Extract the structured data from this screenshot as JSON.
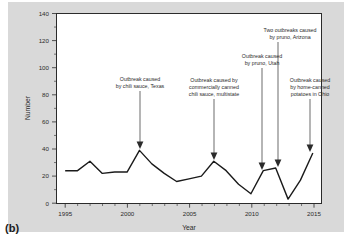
{
  "figure": {
    "panel_label": "(b)",
    "background_color": "#d9d9d9",
    "plot_background_color": "#ffffff",
    "line_color": "#1a1a1a"
  },
  "chart_data": {
    "type": "line",
    "title": "",
    "xlabel": "Year",
    "ylabel": "Number",
    "xlim": [
      1994.3,
      2015.7
    ],
    "ylim": [
      0,
      140
    ],
    "grid": false,
    "legend": null,
    "y_ticks": [
      0,
      20,
      40,
      60,
      80,
      100,
      120,
      140
    ],
    "y_tick_labels": [
      "0",
      "20",
      "40",
      "60",
      "80",
      "100",
      "120",
      "140"
    ],
    "y_minor_tick_step": 10,
    "x_ticks": [
      1995,
      2000,
      2005,
      2010,
      2015
    ],
    "x_tick_labels": [
      "1995",
      "2000",
      "2005",
      "2010",
      "2015"
    ],
    "x_minor_tick_step": 1,
    "x": [
      1995,
      1996,
      1997,
      1998,
      1999,
      2000,
      2001,
      2002,
      2003,
      2004,
      2005,
      2006,
      2007,
      2008,
      2009,
      2010,
      2011,
      2012,
      2013,
      2014,
      2015
    ],
    "values": [
      24,
      24,
      31,
      22,
      23,
      23,
      39,
      29,
      22,
      16,
      18,
      20,
      31,
      24,
      14,
      7,
      24,
      26,
      3,
      17,
      37
    ],
    "series": [
      {
        "name": "Number",
        "values": [
          24,
          24,
          31,
          22,
          23,
          23,
          39,
          29,
          22,
          16,
          18,
          20,
          31,
          24,
          14,
          7,
          24,
          26,
          3,
          17,
          37
        ]
      }
    ],
    "annotations": [
      {
        "id": "chili-sauce-texas",
        "lines": [
          "Outbreak caused",
          "by chili sauce, Texas"
        ],
        "target_x": 2001,
        "target_y": 39
      },
      {
        "id": "commercially-canned-chili-sauce",
        "lines": [
          "Outbreak caused by",
          "commercially canned",
          "chili sauce, multistate"
        ],
        "target_x": 2007,
        "target_y": 31
      },
      {
        "id": "pruno-utah",
        "lines": [
          "Outbreak caused",
          "by pruno, Utah"
        ],
        "target_x": 2011,
        "target_y": 24
      },
      {
        "id": "pruno-arizona",
        "lines": [
          "Two outbreaks caused",
          "by pruno, Arizona"
        ],
        "target_x": 2012,
        "target_y": 26
      },
      {
        "id": "home-canned-potatoes-ohio",
        "lines": [
          "Outbreak caused",
          "by home-canned",
          "potatoes in Ohio"
        ],
        "target_x": 2015,
        "target_y": 37
      }
    ]
  }
}
